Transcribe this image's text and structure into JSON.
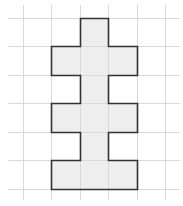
{
  "diagram": {
    "type": "grid-polyomino",
    "grid": {
      "columns": 6,
      "rows": 6
    },
    "shape_cells": [
      [
        0,
        2
      ],
      [
        1,
        1
      ],
      [
        1,
        2
      ],
      [
        1,
        3
      ],
      [
        2,
        2
      ],
      [
        3,
        1
      ],
      [
        3,
        2
      ],
      [
        3,
        3
      ],
      [
        4,
        2
      ],
      [
        5,
        1
      ],
      [
        5,
        2
      ],
      [
        5,
        3
      ]
    ],
    "cell_count": 12,
    "colors": {
      "background": "#ffffff",
      "grid_line": "#d9d9d9",
      "shape_fill": "#eeeeee",
      "shape_outline": "#333333"
    }
  }
}
